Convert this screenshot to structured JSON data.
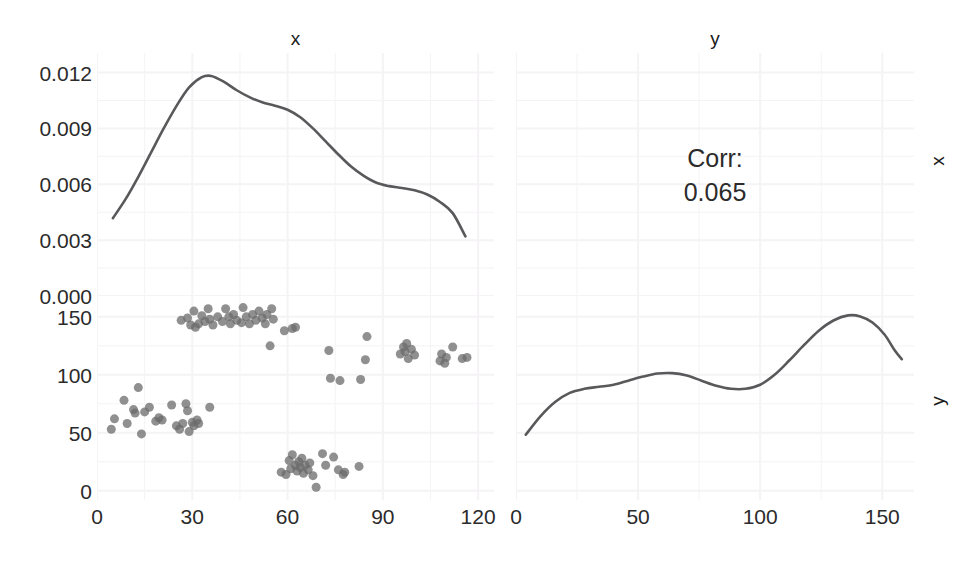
{
  "figure": {
    "kind": "scatterplot-matrix",
    "width": 970,
    "height": 562,
    "background": "#ffffff",
    "point_color": "#6b6b6b",
    "line_color": "#59595b",
    "grid_color": "#f5f3f5",
    "text_color": "#2b2b2b"
  },
  "strips": {
    "columns": [
      {
        "label": "x"
      },
      {
        "label": "y"
      }
    ],
    "rows": [
      {
        "label": "x"
      },
      {
        "label": "y"
      }
    ]
  },
  "axes": {
    "left_y_ticks_row1": [
      "0.012",
      "0.009",
      "0.006",
      "0.003",
      "0.000"
    ],
    "left_y_ticks_row2": [
      "150",
      "100",
      "50",
      "0"
    ],
    "bottom_x_ticks_col1": [
      "0",
      "30",
      "60",
      "90",
      "120"
    ],
    "bottom_x_ticks_col2": [
      "0",
      "50",
      "100",
      "150"
    ]
  },
  "correlation_panel": {
    "label": "Corr:",
    "value": "0.065"
  },
  "chart_data": [
    {
      "id": "panel-1-1",
      "type": "line",
      "title": "x",
      "subtitle": "density of x",
      "xlabel": "x",
      "ylabel": "density",
      "grid": true,
      "xlim": [
        0,
        125
      ],
      "ylim": [
        0.0,
        0.01305
      ],
      "xticks": [
        0,
        30,
        60,
        90,
        120
      ],
      "yticks": [
        0.0,
        0.003,
        0.006,
        0.009,
        0.012
      ],
      "series": [
        {
          "name": "density(x)",
          "x": [
            5,
            9,
            13,
            17,
            21,
            25,
            29,
            33,
            36,
            40,
            44,
            48,
            52,
            56,
            60,
            64,
            68,
            72,
            76,
            80,
            84,
            88,
            92,
            96,
            100,
            104,
            108,
            112,
            116
          ],
          "y": [
            0.00418,
            0.0052,
            0.0064,
            0.0077,
            0.009,
            0.0102,
            0.0112,
            0.01175,
            0.01182,
            0.0115,
            0.01105,
            0.01068,
            0.0104,
            0.01022,
            0.01,
            0.0096,
            0.009,
            0.0083,
            0.0076,
            0.00695,
            0.00645,
            0.00608,
            0.0059,
            0.0058,
            0.00568,
            0.00545,
            0.00505,
            0.00445,
            0.0032
          ]
        }
      ]
    },
    {
      "id": "panel-1-2",
      "type": "table",
      "title": "y",
      "annotation_lines": [
        "Corr:",
        "0.065"
      ],
      "grid": true
    },
    {
      "id": "panel-2-1",
      "type": "scatter",
      "xlabel": "x",
      "ylabel": "y",
      "grid": true,
      "xlim": [
        0,
        125
      ],
      "ylim": [
        -8,
        168
      ],
      "xticks": [
        0,
        30,
        60,
        90,
        120
      ],
      "yticks": [
        0,
        50,
        100,
        150
      ],
      "point_color": "#6b6b6b",
      "point_alpha": 0.75,
      "point_size": 9,
      "points": [
        [
          4.5,
          53
        ],
        [
          5.5,
          62
        ],
        [
          8.5,
          78
        ],
        [
          9.5,
          58
        ],
        [
          11.5,
          70
        ],
        [
          12.0,
          67
        ],
        [
          13.0,
          89
        ],
        [
          14.0,
          49
        ],
        [
          15.0,
          68
        ],
        [
          16.5,
          72
        ],
        [
          18.5,
          60
        ],
        [
          19.5,
          63
        ],
        [
          20.5,
          61
        ],
        [
          23.5,
          74
        ],
        [
          25.0,
          56
        ],
        [
          26.0,
          53
        ],
        [
          27.0,
          58
        ],
        [
          28.0,
          75
        ],
        [
          28.5,
          69
        ],
        [
          29.0,
          51
        ],
        [
          30.0,
          59
        ],
        [
          30.5,
          56
        ],
        [
          31.5,
          61
        ],
        [
          32.0,
          58
        ],
        [
          35.5,
          72
        ],
        [
          26.5,
          147
        ],
        [
          28.5,
          149
        ],
        [
          29.5,
          143
        ],
        [
          30.5,
          155
        ],
        [
          31.0,
          141
        ],
        [
          32.0,
          144
        ],
        [
          33.0,
          151
        ],
        [
          34.0,
          146
        ],
        [
          35.0,
          157
        ],
        [
          35.5,
          148
        ],
        [
          36.5,
          143
        ],
        [
          38.0,
          150
        ],
        [
          39.5,
          146
        ],
        [
          40.5,
          157
        ],
        [
          41.5,
          150
        ],
        [
          42.0,
          144
        ],
        [
          43.0,
          152
        ],
        [
          44.0,
          147
        ],
        [
          45.5,
          145
        ],
        [
          46.0,
          158
        ],
        [
          47.0,
          150
        ],
        [
          48.0,
          144
        ],
        [
          49.0,
          152
        ],
        [
          50.0,
          147
        ],
        [
          51.0,
          155
        ],
        [
          52.0,
          149
        ],
        [
          53.0,
          144
        ],
        [
          53.5,
          152
        ],
        [
          55.0,
          157
        ],
        [
          55.5,
          148
        ],
        [
          54.5,
          125
        ],
        [
          59.0,
          138
        ],
        [
          61.5,
          140
        ],
        [
          62.5,
          141
        ],
        [
          58.0,
          16
        ],
        [
          59.5,
          14
        ],
        [
          60.5,
          26
        ],
        [
          61.0,
          19
        ],
        [
          61.5,
          31
        ],
        [
          62.5,
          22
        ],
        [
          63.0,
          17
        ],
        [
          63.5,
          25
        ],
        [
          64.0,
          20
        ],
        [
          64.5,
          28
        ],
        [
          65.0,
          15
        ],
        [
          65.5,
          22
        ],
        [
          66.5,
          18
        ],
        [
          67.0,
          24
        ],
        [
          68.0,
          13
        ],
        [
          69.0,
          3
        ],
        [
          71.0,
          32
        ],
        [
          72.0,
          22
        ],
        [
          74.5,
          29
        ],
        [
          76.0,
          18
        ],
        [
          77.5,
          14
        ],
        [
          78.0,
          16
        ],
        [
          82.5,
          21
        ],
        [
          73.5,
          97
        ],
        [
          76.5,
          95
        ],
        [
          83.0,
          96
        ],
        [
          73.0,
          121
        ],
        [
          84.5,
          113
        ],
        [
          85.0,
          133
        ],
        [
          95.5,
          118
        ],
        [
          96.5,
          124
        ],
        [
          97.0,
          120
        ],
        [
          97.5,
          127
        ],
        [
          98.0,
          114
        ],
        [
          99.0,
          122
        ],
        [
          100.0,
          117
        ],
        [
          108.0,
          112
        ],
        [
          108.5,
          118
        ],
        [
          109.5,
          110
        ],
        [
          110.0,
          115
        ],
        [
          112.0,
          124
        ],
        [
          115.0,
          114
        ],
        [
          116.5,
          115
        ]
      ]
    },
    {
      "id": "panel-2-2",
      "type": "line",
      "title": "y",
      "subtitle": "density of y",
      "xlabel": "y",
      "ylabel": "density",
      "grid": true,
      "xlim": [
        0,
        163
      ],
      "ylim": [
        0,
        1
      ],
      "xticks": [
        0,
        50,
        100,
        150
      ],
      "series": [
        {
          "name": "density(y)",
          "x": [
            4,
            10,
            16,
            22,
            28,
            34,
            40,
            46,
            52,
            58,
            64,
            70,
            76,
            82,
            88,
            94,
            100,
            106,
            112,
            118,
            124,
            130,
            136,
            141,
            146,
            151,
            155,
            158
          ],
          "y": [
            0.32,
            0.41,
            0.48,
            0.525,
            0.545,
            0.555,
            0.565,
            0.585,
            0.605,
            0.62,
            0.622,
            0.61,
            0.585,
            0.56,
            0.545,
            0.545,
            0.565,
            0.615,
            0.685,
            0.76,
            0.83,
            0.88,
            0.905,
            0.9,
            0.87,
            0.81,
            0.735,
            0.69
          ]
        }
      ]
    }
  ]
}
